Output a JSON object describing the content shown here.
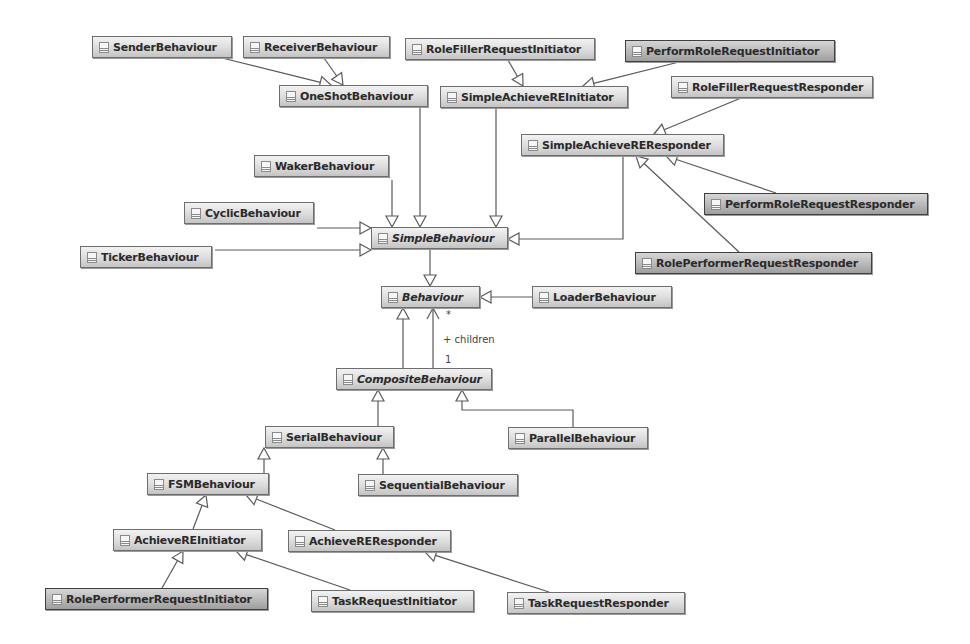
{
  "diagram": {
    "type": "UML class diagram",
    "classes": [
      {
        "id": "SenderBehaviour",
        "name": "SenderBehaviour",
        "x": 92,
        "y": 36,
        "w": 140,
        "abstract": false,
        "dark": false
      },
      {
        "id": "ReceiverBehaviour",
        "name": "ReceiverBehaviour",
        "x": 243,
        "y": 36,
        "w": 147,
        "abstract": false,
        "dark": false
      },
      {
        "id": "RoleFillerRequestInitiator",
        "name": "RoleFillerRequestInitiator",
        "x": 405,
        "y": 38,
        "w": 190,
        "abstract": false,
        "dark": false
      },
      {
        "id": "PerformRoleRequestInitiator",
        "name": "PerformRoleRequestInitiator",
        "x": 625,
        "y": 40,
        "w": 210,
        "abstract": false,
        "dark": true
      },
      {
        "id": "OneShotBehaviour",
        "name": "OneShotBehaviour",
        "x": 279,
        "y": 85,
        "w": 149,
        "abstract": false,
        "dark": false
      },
      {
        "id": "SimpleAchieveREInitiator",
        "name": "SimpleAchieveREInitiator",
        "x": 440,
        "y": 86,
        "w": 188,
        "abstract": false,
        "dark": false
      },
      {
        "id": "RoleFillerRequestResponder",
        "name": "RoleFillerRequestResponder",
        "x": 671,
        "y": 76,
        "w": 202,
        "abstract": false,
        "dark": false
      },
      {
        "id": "SimpleAchieveREResponder",
        "name": "SimpleAchieveREResponder",
        "x": 521,
        "y": 134,
        "w": 203,
        "abstract": false,
        "dark": false
      },
      {
        "id": "WakerBehaviour",
        "name": "WakerBehaviour",
        "x": 254,
        "y": 155,
        "w": 135,
        "abstract": false,
        "dark": false
      },
      {
        "id": "CyclicBehaviour",
        "name": "CyclicBehaviour",
        "x": 184,
        "y": 202,
        "w": 130,
        "abstract": false,
        "dark": false
      },
      {
        "id": "SimpleBehaviour",
        "name": "SimpleBehaviour",
        "x": 371,
        "y": 227,
        "w": 137,
        "abstract": true,
        "dark": false
      },
      {
        "id": "TickerBehaviour",
        "name": "TickerBehaviour",
        "x": 80,
        "y": 246,
        "w": 132,
        "abstract": false,
        "dark": false
      },
      {
        "id": "PerformRoleRequestResponder",
        "name": "PerformRoleRequestResponder",
        "x": 704,
        "y": 193,
        "w": 224,
        "abstract": false,
        "dark": true
      },
      {
        "id": "RolePerformerRequestResponder",
        "name": "RolePerformerRequestResponder",
        "x": 635,
        "y": 252,
        "w": 237,
        "abstract": false,
        "dark": true
      },
      {
        "id": "Behaviour",
        "name": "Behaviour",
        "x": 381,
        "y": 286,
        "w": 99,
        "abstract": true,
        "dark": false
      },
      {
        "id": "LoaderBehaviour",
        "name": "LoaderBehaviour",
        "x": 532,
        "y": 286,
        "w": 140,
        "abstract": false,
        "dark": false
      },
      {
        "id": "CompositeBehaviour",
        "name": "CompositeBehaviour",
        "x": 336,
        "y": 368,
        "w": 156,
        "abstract": true,
        "dark": false
      },
      {
        "id": "SerialBehaviour",
        "name": "SerialBehaviour",
        "x": 265,
        "y": 426,
        "w": 129,
        "abstract": false,
        "dark": false
      },
      {
        "id": "ParallelBehaviour",
        "name": "ParallelBehaviour",
        "x": 508,
        "y": 427,
        "w": 140,
        "abstract": false,
        "dark": false
      },
      {
        "id": "FSMBehaviour",
        "name": "FSMBehaviour",
        "x": 147,
        "y": 473,
        "w": 122,
        "abstract": false,
        "dark": false
      },
      {
        "id": "SequentialBehaviour",
        "name": "SequentialBehaviour",
        "x": 358,
        "y": 474,
        "w": 160,
        "abstract": false,
        "dark": false
      },
      {
        "id": "AchieveREInitiator",
        "name": "AchieveREInitiator",
        "x": 113,
        "y": 529,
        "w": 149,
        "abstract": false,
        "dark": false
      },
      {
        "id": "AchieveREResponder",
        "name": "AchieveREResponder",
        "x": 288,
        "y": 530,
        "w": 163,
        "abstract": false,
        "dark": false
      },
      {
        "id": "RolePerformerRequestInitiator",
        "name": "RolePerformerRequestInitiator",
        "x": 45,
        "y": 588,
        "w": 223,
        "abstract": false,
        "dark": true
      },
      {
        "id": "TaskRequestInitiator",
        "name": "TaskRequestInitiator",
        "x": 311,
        "y": 590,
        "w": 163,
        "abstract": false,
        "dark": false
      },
      {
        "id": "TaskRequestResponder",
        "name": "TaskRequestResponder",
        "x": 507,
        "y": 592,
        "w": 178,
        "abstract": false,
        "dark": false
      }
    ],
    "generalizations": [
      {
        "from": "SenderBehaviour",
        "to": "OneShotBehaviour",
        "points": [
          [
            222,
            58
          ],
          [
            331,
            85
          ]
        ]
      },
      {
        "from": "ReceiverBehaviour",
        "to": "OneShotBehaviour",
        "points": [
          [
            324,
            58
          ],
          [
            343,
            85
          ]
        ]
      },
      {
        "from": "RoleFillerRequestInitiator",
        "to": "SimpleAchieveREInitiator",
        "points": [
          [
            508,
            60
          ],
          [
            523,
            86
          ]
        ]
      },
      {
        "from": "PerformRoleRequestInitiator",
        "to": "SimpleAchieveREInitiator",
        "points": [
          [
            679,
            62
          ],
          [
            583,
            86
          ]
        ]
      },
      {
        "from": "RoleFillerRequestResponder",
        "to": "SimpleAchieveREResponder",
        "points": [
          [
            741,
            98
          ],
          [
            654,
            134
          ]
        ]
      },
      {
        "from": "OneShotBehaviour",
        "to": "SimpleBehaviour",
        "points": [
          [
            420,
            107
          ],
          [
            420,
            227
          ]
        ]
      },
      {
        "from": "SimpleAchieveREInitiator",
        "to": "SimpleBehaviour",
        "points": [
          [
            496,
            108
          ],
          [
            496,
            227
          ]
        ]
      },
      {
        "from": "WakerBehaviour",
        "to": "SimpleBehaviour",
        "points": [
          [
            392,
            180
          ],
          [
            392,
            227
          ]
        ]
      },
      {
        "from": "CyclicBehaviour",
        "to": "SimpleBehaviour",
        "points": [
          [
            317,
            228
          ],
          [
            371,
            228
          ]
        ]
      },
      {
        "from": "TickerBehaviour",
        "to": "SimpleBehaviour",
        "points": [
          [
            215,
            250
          ],
          [
            371,
            250
          ]
        ]
      },
      {
        "from": "SimpleAchieveREResponder",
        "to": "SimpleBehaviour",
        "points": [
          [
            623,
            156
          ],
          [
            623,
            239
          ],
          [
            508,
            239
          ]
        ]
      },
      {
        "from": "PerformRoleRequestResponder",
        "to": "SimpleAchieveREResponder",
        "points": [
          [
            776,
            193
          ],
          [
            666,
            156
          ]
        ]
      },
      {
        "from": "RolePerformerRequestResponder",
        "to": "SimpleAchieveREResponder",
        "points": [
          [
            739,
            252
          ],
          [
            636,
            156
          ]
        ]
      },
      {
        "from": "SimpleBehaviour",
        "to": "Behaviour",
        "points": [
          [
            430,
            249
          ],
          [
            430,
            286
          ]
        ]
      },
      {
        "from": "LoaderBehaviour",
        "to": "Behaviour",
        "points": [
          [
            532,
            297
          ],
          [
            480,
            297
          ]
        ]
      },
      {
        "from": "CompositeBehaviour",
        "to": "Behaviour",
        "points": [
          [
            403,
            368
          ],
          [
            403,
            308
          ]
        ]
      },
      {
        "from": "SerialBehaviour",
        "to": "CompositeBehaviour",
        "points": [
          [
            378,
            426
          ],
          [
            378,
            390
          ]
        ]
      },
      {
        "from": "ParallelBehaviour",
        "to": "CompositeBehaviour",
        "points": [
          [
            573,
            427
          ],
          [
            573,
            410
          ],
          [
            462,
            410
          ],
          [
            462,
            390
          ]
        ]
      },
      {
        "from": "FSMBehaviour",
        "to": "SerialBehaviour",
        "points": [
          [
            264,
            473
          ],
          [
            264,
            448
          ]
        ]
      },
      {
        "from": "SequentialBehaviour",
        "to": "SerialBehaviour",
        "points": [
          [
            383,
            474
          ],
          [
            383,
            448
          ]
        ]
      },
      {
        "from": "AchieveREInitiator",
        "to": "FSMBehaviour",
        "points": [
          [
            193,
            529
          ],
          [
            206,
            495
          ]
        ]
      },
      {
        "from": "AchieveREResponder",
        "to": "FSMBehaviour",
        "points": [
          [
            335,
            530
          ],
          [
            246,
            495
          ]
        ]
      },
      {
        "from": "RolePerformerRequestInitiator",
        "to": "AchieveREInitiator",
        "points": [
          [
            162,
            588
          ],
          [
            183,
            551
          ]
        ]
      },
      {
        "from": "TaskRequestInitiator",
        "to": "AchieveREInitiator",
        "points": [
          [
            350,
            590
          ],
          [
            236,
            551
          ]
        ]
      },
      {
        "from": "TaskRequestResponder",
        "to": "AchieveREResponder",
        "points": [
          [
            549,
            592
          ],
          [
            425,
            552
          ]
        ]
      }
    ],
    "associations": [
      {
        "from": "CompositeBehaviour",
        "to": "Behaviour",
        "points": [
          [
            433,
            368
          ],
          [
            433,
            308
          ]
        ],
        "navigable_end": "Behaviour"
      }
    ],
    "association_labels": {
      "multiplicity_target": "*",
      "role_name": "+ children",
      "multiplicity_source": "1"
    }
  },
  "styles": {
    "line_color": "#5a5a5a",
    "box_border": "#6e6e6e",
    "text_color": "#2a2a2a"
  }
}
